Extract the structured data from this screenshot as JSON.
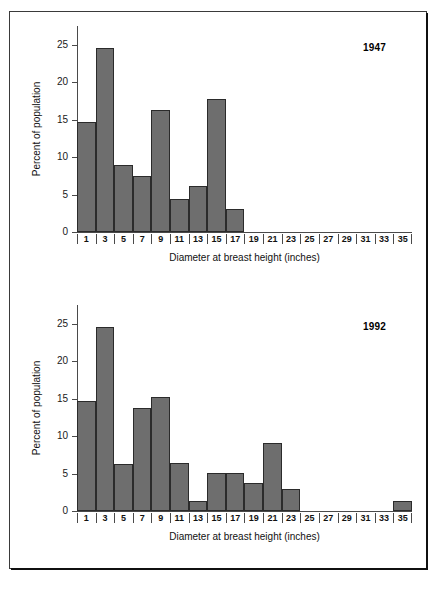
{
  "figure": {
    "panels": [
      {
        "name": "panel-1947",
        "year_label": "1947",
        "xlabel": "Diameter at breast height (inches)",
        "ylabel": "Percent of population"
      },
      {
        "name": "panel-1992",
        "year_label": "1992",
        "xlabel": "Diameter at breast height (inches)",
        "ylabel": "Percent of population"
      }
    ],
    "bar_color": "#6e6e6e",
    "bar_edge_color": "#2b2b2b",
    "frame_color": "#3a3a3a",
    "axis_color": "#4a4a4a"
  },
  "chart_data": [
    {
      "type": "bar",
      "title": "1947",
      "xlabel": "Diameter at breast height (inches)",
      "ylabel": "Percent of population",
      "categories": [
        "1",
        "3",
        "5",
        "7",
        "9",
        "11",
        "13",
        "15",
        "17",
        "19",
        "21",
        "23",
        "25",
        "27",
        "29",
        "31",
        "33",
        "35"
      ],
      "values": [
        14.7,
        24.5,
        8.9,
        7.5,
        16.3,
        4.4,
        6.1,
        17.7,
        3.1,
        0,
        0,
        0,
        0,
        0,
        0,
        0,
        0,
        0
      ],
      "yticks": [
        0,
        5,
        10,
        15,
        20,
        25
      ],
      "ylim": [
        0,
        27.5
      ],
      "grid": false,
      "legend": "none"
    },
    {
      "type": "bar",
      "title": "1992",
      "xlabel": "Diameter at breast height (inches)",
      "ylabel": "Percent of population",
      "categories": [
        "1",
        "3",
        "5",
        "7",
        "9",
        "11",
        "13",
        "15",
        "17",
        "19",
        "21",
        "23",
        "25",
        "27",
        "29",
        "31",
        "33",
        "35"
      ],
      "values": [
        14.7,
        24.6,
        6.3,
        13.8,
        15.2,
        6.4,
        1.4,
        5.1,
        5.1,
        3.7,
        9.1,
        2.9,
        0,
        0,
        0,
        0,
        0,
        1.4
      ],
      "yticks": [
        0,
        5,
        10,
        15,
        20,
        25
      ],
      "ylim": [
        0,
        27.5
      ],
      "grid": false,
      "legend": "none"
    }
  ]
}
